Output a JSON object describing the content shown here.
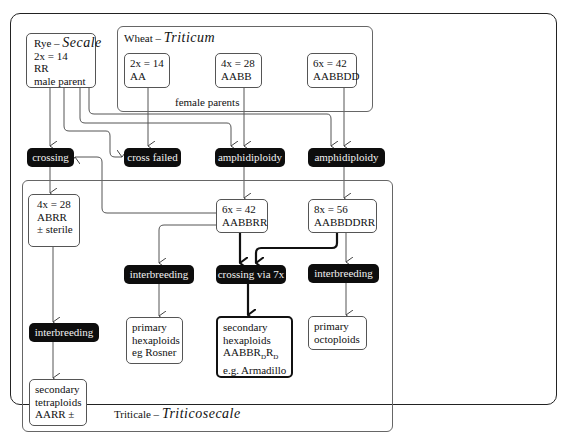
{
  "groups": {
    "rye": {
      "title_prefix": "Rye –",
      "title_italic": "Secale",
      "lines": [
        "2x = 14",
        "RR",
        "male parent"
      ]
    },
    "wheat": {
      "title_prefix": "Wheat –",
      "title_italic": "Triticum",
      "footer": "female parents",
      "parents": [
        {
          "lines": [
            "2x = 14",
            "AA"
          ]
        },
        {
          "lines": [
            "4x = 28",
            "AABB"
          ]
        },
        {
          "lines": [
            "6x = 42",
            "AABBDD"
          ]
        }
      ]
    },
    "triticale": {
      "title_prefix": "Triticale –",
      "title_italic": "Triticosecale"
    }
  },
  "processes": {
    "crossing": "crossing",
    "cross_failed": "cross failed",
    "amphidiploidy_1": "amphidiploidy",
    "amphidiploidy_2": "amphidiploidy",
    "interbreeding_left": "interbreeding",
    "interbreeding_mid": "interbreeding",
    "crossing_7x": "crossing via 7x",
    "interbreeding_right": "interbreeding"
  },
  "nodes": {
    "abrr": [
      "4x = 28",
      "ABRR",
      "± sterile"
    ],
    "aabbrr": [
      "6x = 42",
      "AABBRR"
    ],
    "aabbddrr": [
      "8x = 56",
      "AABBDDRR"
    ],
    "sec_tetra": [
      "secondary",
      "tetraploids",
      "AARR ±"
    ],
    "prim_hexa": [
      "primary",
      "hexaploids",
      "eg Rosner"
    ],
    "sec_hexa": {
      "l1": "secondary",
      "l2": "hexaploids",
      "l3_pre": "AABBR",
      "sub1": "D",
      "l3_mid": "R",
      "sub2": "D",
      "l4": "e.g. Armadillo"
    },
    "prim_octo": [
      "primary",
      "octoploids"
    ]
  }
}
